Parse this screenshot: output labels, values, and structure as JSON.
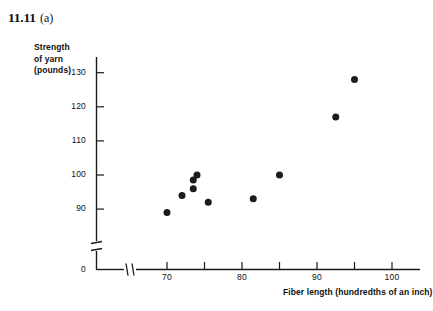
{
  "figure": {
    "number": "11.11",
    "part": "(a)"
  },
  "axes": {
    "y_title_lines": [
      "Strength",
      "of yarn",
      "(pounds)"
    ],
    "x_title": "Fiber length (hundredths of an inch)",
    "y_ticks": [
      "130",
      "120",
      "110",
      "100",
      "90"
    ],
    "y_origin_label": "0",
    "x_ticks": [
      "70",
      "80",
      "90",
      "100"
    ],
    "y_break": true,
    "x_break": true
  },
  "colors": {
    "axis": "#1a1a1a",
    "point": "#1c1c1c",
    "background": "#ffffff"
  },
  "chart_data": {
    "type": "scatter",
    "xlabel": "Fiber length (hundredths of an inch)",
    "ylabel": "Strength of yarn (pounds)",
    "xlim": [
      68,
      102
    ],
    "ylim": [
      88,
      132
    ],
    "xticks": [
      70,
      80,
      90,
      100
    ],
    "xticks_minor": [
      75,
      85,
      95
    ],
    "yticks": [
      90,
      100,
      110,
      120,
      130
    ],
    "grid": false,
    "legend": null,
    "axis_break_x": true,
    "axis_break_y": true,
    "series": [
      {
        "name": "Fiber length vs strength of yarn",
        "points": [
          {
            "x": 70.0,
            "y": 89.0
          },
          {
            "x": 72.0,
            "y": 94.0
          },
          {
            "x": 73.5,
            "y": 96.0
          },
          {
            "x": 73.5,
            "y": 98.5
          },
          {
            "x": 74.0,
            "y": 100.0
          },
          {
            "x": 75.5,
            "y": 92.0
          },
          {
            "x": 81.5,
            "y": 93.0
          },
          {
            "x": 85.0,
            "y": 100.0
          },
          {
            "x": 92.5,
            "y": 117.0
          },
          {
            "x": 95.0,
            "y": 128.0
          }
        ]
      }
    ]
  }
}
